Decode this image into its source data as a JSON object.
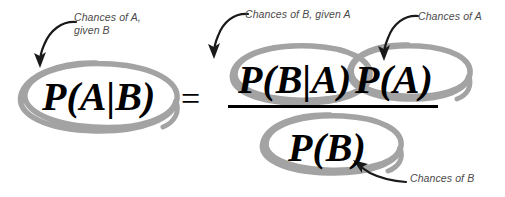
{
  "diagram": {
    "background_color": "#ffffff",
    "circle_color": "#a3a3a3",
    "text_color": "#4a4a4a",
    "formula_color": "#000000"
  },
  "formula": {
    "left_side": "P(A|B)",
    "equals": "=",
    "numerator_first": "P(B|A)",
    "numerator_second": "P(A)",
    "denominator": "P(B)"
  },
  "annotations": [
    {
      "id": "chances-of-a-given-b",
      "text": "Chances of A,\ngiven B",
      "target": "P(A|B)"
    },
    {
      "id": "chances-of-b-given-a",
      "text": "Chances of B, given A",
      "target": "P(B|A)"
    },
    {
      "id": "chances-of-a",
      "text": "Chances of A",
      "target": "P(A)"
    },
    {
      "id": "chances-of-b",
      "text": "Chances of B",
      "target": "P(B)"
    }
  ]
}
